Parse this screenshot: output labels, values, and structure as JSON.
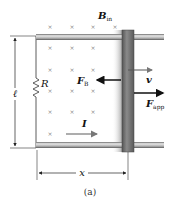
{
  "figure": {
    "caption": "(a)",
    "field_label": {
      "main": "B",
      "sub": "in"
    },
    "resistor_label": "R",
    "length_label": "ℓ",
    "position_label": "x",
    "current_label": "I",
    "velocity_label": "v",
    "magnetic_force_label": {
      "main": "F",
      "sub": "B"
    },
    "applied_force_label": {
      "main": "F",
      "sub": "app"
    },
    "field_marker": "×"
  },
  "colors": {
    "rail": "#b9b9b9",
    "rail_edge": "#4a4a4a",
    "bar": "#7d7d7d",
    "bar_shadow": "#c8c8c8",
    "arrow": "#111111",
    "marker": "#888888",
    "current_arrow": "#777777"
  },
  "field_grid": {
    "columns_x": [
      50,
      72,
      93,
      115
    ],
    "rows_y": [
      27,
      48,
      70,
      91,
      112,
      134
    ]
  }
}
